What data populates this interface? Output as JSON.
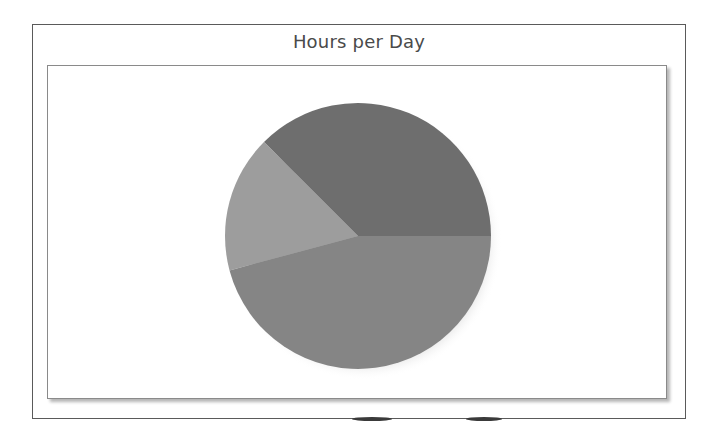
{
  "chart_data": {
    "type": "pie",
    "title": "Hours per Day",
    "total": 24,
    "slices": [
      {
        "name": "",
        "value": 9,
        "color": "#6e6e6e"
      },
      {
        "name": "",
        "value": 4,
        "color": "#9d9d9d"
      },
      {
        "name": "",
        "value": 11,
        "color": "#858585"
      }
    ],
    "start_angle_deg": 0,
    "direction": "counterclockwise",
    "legend": "none",
    "labels": "none"
  },
  "chart": {
    "title": "Hours per Day"
  }
}
